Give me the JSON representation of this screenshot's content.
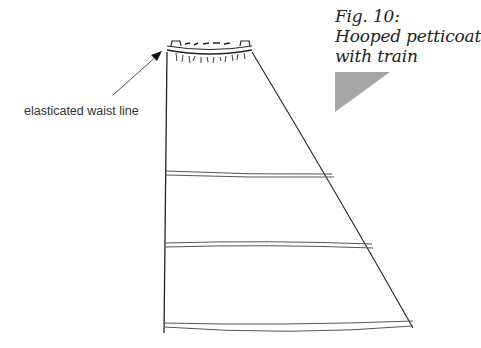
{
  "figure": {
    "caption": {
      "line1": "Fig. 10:",
      "line2": "Hooped petticoat",
      "line3": "with train"
    },
    "annotations": [
      {
        "text": "elasticated waist line",
        "target": "waistband"
      }
    ],
    "colors": {
      "line": "#222222",
      "hoop": "#555555",
      "accent_triangle": "#a6a6a6",
      "background": "#ffffff"
    }
  }
}
